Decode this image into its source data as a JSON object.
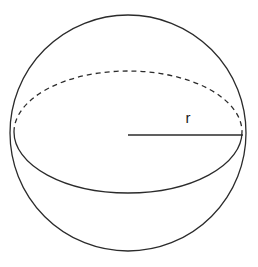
{
  "figure": {
    "background_color": "#ffffff",
    "stroke_color": "#2b2b2b",
    "label_color": "#1a1a1a",
    "labels": {
      "radius": "r"
    },
    "geometry": {
      "canvas_width": 258,
      "canvas_height": 267,
      "sphere_outline": {
        "shape": "circle",
        "center_x": 128,
        "center_y": 133,
        "radius": 118,
        "stroke_width": 1.3,
        "style": "solid"
      },
      "equator_back": {
        "shape": "ellipse-arc-upper",
        "center_x": 128,
        "center_y": 132,
        "radius_x": 114,
        "radius_y": 61,
        "stroke_width": 1.3,
        "style": "dashed",
        "dash_pattern": "5 4"
      },
      "equator_front": {
        "shape": "ellipse-arc-lower",
        "center_x": 128,
        "center_y": 132,
        "radius_x": 114,
        "radius_y": 61,
        "stroke_width": 1.3,
        "style": "solid"
      },
      "radius_segment": {
        "shape": "line",
        "x1": 128,
        "y1": 135,
        "x2": 243,
        "y2": 135,
        "stroke_width": 1.6,
        "style": "solid"
      },
      "radius_label_position": {
        "x": 188,
        "y": 123
      }
    }
  }
}
